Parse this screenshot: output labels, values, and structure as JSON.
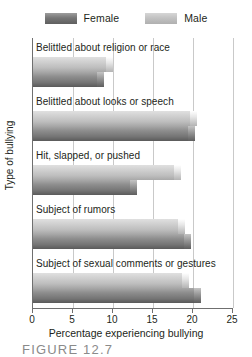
{
  "chart_data": {
    "type": "bar",
    "orientation": "horizontal",
    "title": "",
    "xlabel": "Percentage experiencing bullying",
    "ylabel": "Type of bullying",
    "xlim": [
      0,
      25
    ],
    "xticks": [
      0,
      5,
      10,
      15,
      20,
      25
    ],
    "grid": true,
    "legend_position": "top-center",
    "categories": [
      "Belittled about religion or race",
      "Belittled about looks or speech",
      "Hit, slapped, or pushed",
      "Subject of rumors",
      "Subject of sexual comments or gestures"
    ],
    "series": [
      {
        "name": "Male",
        "color": "#c6c6c6",
        "values": [
          10.0,
          20.5,
          18.5,
          19.0,
          19.5
        ]
      },
      {
        "name": "Female",
        "color": "#767676",
        "values": [
          8.9,
          20.2,
          13.0,
          19.7,
          21.0
        ]
      }
    ]
  },
  "legend": {
    "items": [
      {
        "label": "Female",
        "swatch": "swatch-female"
      },
      {
        "label": "Male",
        "swatch": "swatch-male"
      }
    ]
  },
  "axis": {
    "x_title": "Percentage experiencing bullying",
    "y_title": "Type of bullying",
    "tick_labels": [
      "0",
      "5",
      "10",
      "15",
      "20",
      "25"
    ]
  },
  "caption": {
    "text": "FIGURE 12.7"
  }
}
